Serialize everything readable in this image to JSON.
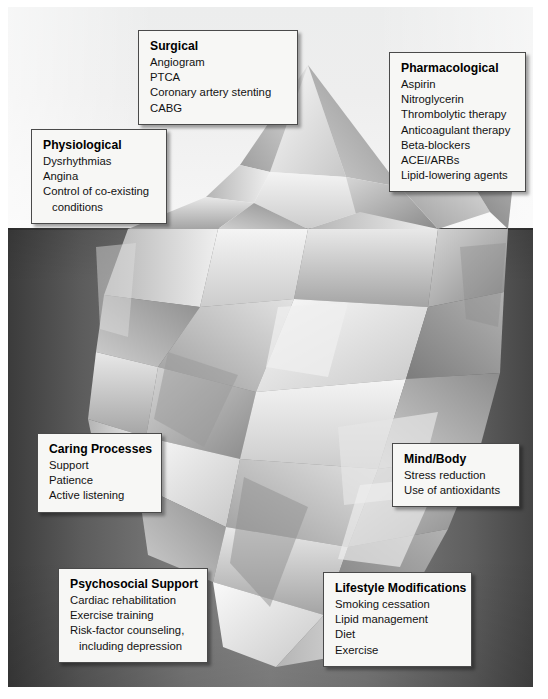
{
  "figure": {
    "name": "iceberg-diagram"
  },
  "scene": {
    "sky_label": "above-water",
    "water_label": "below-water",
    "waterline_y": 228,
    "colors": {
      "sky": "#eeeeee",
      "water_dark": "#3b3b3b",
      "water_light": "#8b8b8b",
      "iceberg_light": "#f2f2f2",
      "iceberg_mid": "#bfbfbf",
      "iceberg_dark": "#8e8e8e",
      "box_fill": "#f7f7f5",
      "box_border": "#4a4a4a",
      "text": "#121212"
    }
  },
  "callouts": [
    {
      "id": "surgical",
      "title": "Surgical",
      "items": [
        {
          "text": "Angiogram",
          "indent": false
        },
        {
          "text": "PTCA",
          "indent": false
        },
        {
          "text": "Coronary artery stenting",
          "indent": false
        },
        {
          "text": "CABG",
          "indent": false
        }
      ]
    },
    {
      "id": "pharmacological",
      "title": "Pharmacological",
      "items": [
        {
          "text": "Aspirin",
          "indent": false
        },
        {
          "text": "Nitroglycerin",
          "indent": false
        },
        {
          "text": "Thrombolytic therapy",
          "indent": false
        },
        {
          "text": "Anticoagulant therapy",
          "indent": false
        },
        {
          "text": "Beta-blockers",
          "indent": false
        },
        {
          "text": "ACEI/ARBs",
          "indent": false
        },
        {
          "text": "Lipid-lowering agents",
          "indent": false
        }
      ]
    },
    {
      "id": "physiological",
      "title": "Physiological",
      "items": [
        {
          "text": "Dysrhythmias",
          "indent": false
        },
        {
          "text": "Angina",
          "indent": false
        },
        {
          "text": "Control of co-existing",
          "indent": false
        },
        {
          "text": "conditions",
          "indent": true
        }
      ]
    },
    {
      "id": "caring-processes",
      "title": "Caring Processes",
      "items": [
        {
          "text": "Support",
          "indent": false
        },
        {
          "text": "Patience",
          "indent": false
        },
        {
          "text": "Active listening",
          "indent": false
        }
      ]
    },
    {
      "id": "mind-body",
      "title": "Mind/Body",
      "items": [
        {
          "text": "Stress reduction",
          "indent": false
        },
        {
          "text": "Use of antioxidants",
          "indent": false
        }
      ]
    },
    {
      "id": "psychosocial-support",
      "title": "Psychosocial Support",
      "items": [
        {
          "text": "Cardiac rehabilitation",
          "indent": false
        },
        {
          "text": "Exercise training",
          "indent": false
        },
        {
          "text": "Risk-factor counseling,",
          "indent": false
        },
        {
          "text": "including depression",
          "indent": true
        }
      ]
    },
    {
      "id": "lifestyle-modifications",
      "title": "Lifestyle Modifications",
      "items": [
        {
          "text": "Smoking cessation",
          "indent": false
        },
        {
          "text": "Lipid management",
          "indent": false
        },
        {
          "text": "Diet",
          "indent": false
        },
        {
          "text": "Exercise",
          "indent": false
        }
      ]
    }
  ]
}
